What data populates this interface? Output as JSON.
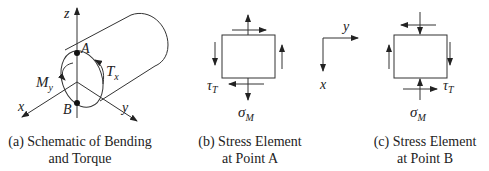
{
  "figure_a": {
    "axes": {
      "z": "z",
      "x": "x",
      "y": "y"
    },
    "points": {
      "A": "A",
      "B": "B"
    },
    "moments": {
      "bending": "M",
      "bending_sub": "y",
      "torque": "T",
      "torque_sub": "x"
    },
    "caption_line1": "(a) Schematic of Bending",
    "caption_line2": "and Torque"
  },
  "figure_b": {
    "shear_label": "τ",
    "shear_sub": "T",
    "normal_label": "σ",
    "normal_sub": "M",
    "caption_line1": "(b) Stress Element",
    "caption_line2": "at Point A"
  },
  "axes_ref": {
    "y": "y",
    "x": "x"
  },
  "figure_c": {
    "shear_label": "τ",
    "shear_sub": "T",
    "normal_label": "σ",
    "normal_sub": "M",
    "caption_line1": "(c) Stress Element",
    "caption_line2": "at Point B"
  }
}
